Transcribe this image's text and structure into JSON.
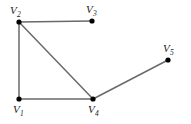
{
  "figure": {
    "background_color": "#ffffff",
    "width": 191,
    "height": 124
  },
  "chart_data": {
    "type": "diagram",
    "subtype": "undirected-graph",
    "title": "",
    "xlabel": "",
    "ylabel": "",
    "grid": false,
    "legend": null,
    "node_color": "#000000",
    "edge_color": "#6a6a6a",
    "edge_width": 1.5,
    "node_radius": 2.6,
    "nodes": [
      {
        "id": "V1",
        "label": "V",
        "subscript": "1",
        "x": 19,
        "y": 99,
        "label_x": 13,
        "label_y": 104
      },
      {
        "id": "V2",
        "label": "V",
        "subscript": "2",
        "x": 19,
        "y": 22,
        "label_x": 10,
        "label_y": 5
      },
      {
        "id": "V3",
        "label": "V",
        "subscript": "3",
        "x": 92,
        "y": 21,
        "label_x": 86,
        "label_y": 4
      },
      {
        "id": "V4",
        "label": "V",
        "subscript": "4",
        "x": 93,
        "y": 99,
        "label_x": 88,
        "label_y": 104
      },
      {
        "id": "V5",
        "label": "V",
        "subscript": "5",
        "x": 168,
        "y": 60,
        "label_x": 163,
        "label_y": 43
      }
    ],
    "edges": [
      {
        "id": "edge-v2-v3",
        "source": "V2",
        "target": "V3"
      },
      {
        "id": "edge-v2-v1",
        "source": "V2",
        "target": "V1"
      },
      {
        "id": "edge-v2-v4",
        "source": "V2",
        "target": "V4"
      },
      {
        "id": "edge-v1-v4",
        "source": "V1",
        "target": "V4"
      },
      {
        "id": "edge-v4-v5",
        "source": "V4",
        "target": "V5"
      }
    ]
  }
}
